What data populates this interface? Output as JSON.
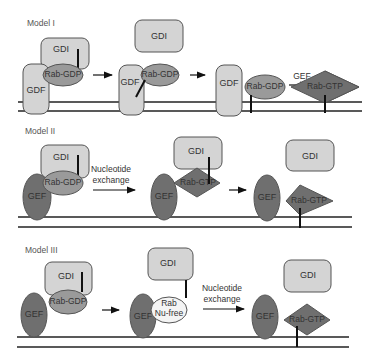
{
  "colors": {
    "light_shape": "#d4d4d4",
    "dark_shape": "#6f6f6f",
    "rab_gdp": "#9a9a9a",
    "rab_free": "#f4f4f4",
    "stroke": "#555555",
    "membrane": "#222222"
  },
  "models": [
    {
      "title": "Model I",
      "labels": {
        "gdi_1": "GDI",
        "gdf_1": "GDF",
        "rab_1": "Rab-GDP",
        "gdi_2": "GDI",
        "gdf_2": "GDF",
        "rab_2": "Rab-GDP",
        "gdf_3": "GDF",
        "rab_3": "Rab-GDP",
        "arrow_label": "GEF",
        "rab_4": "Rab-GTP"
      }
    },
    {
      "title": "Model II",
      "labels": {
        "gdi_1": "GDI",
        "gef_1": "GEF",
        "rab_1": "Rab-GDP",
        "arrow_label_1": "Nucleotide",
        "arrow_label_2": "exchange",
        "gdi_2": "GDI",
        "gef_2": "GEF",
        "rab_2": "Rab-GTP",
        "gdi_3": "GDI",
        "gef_3": "GEF",
        "rab_3": "Rab-GTP"
      }
    },
    {
      "title": "Model III",
      "labels": {
        "gdi_1": "GDI",
        "gef_1": "GEF",
        "rab_1": "Rab-GDP",
        "gdi_2": "GDI",
        "gef_2": "GEF",
        "rab_2a": "Rab",
        "rab_2b": "Nu-free",
        "arrow_label_1": "Nucleotide",
        "arrow_label_2": "exchange",
        "gdi_3": "GDI",
        "gef_3": "GEF",
        "rab_3": "Rab-GTP"
      }
    }
  ]
}
